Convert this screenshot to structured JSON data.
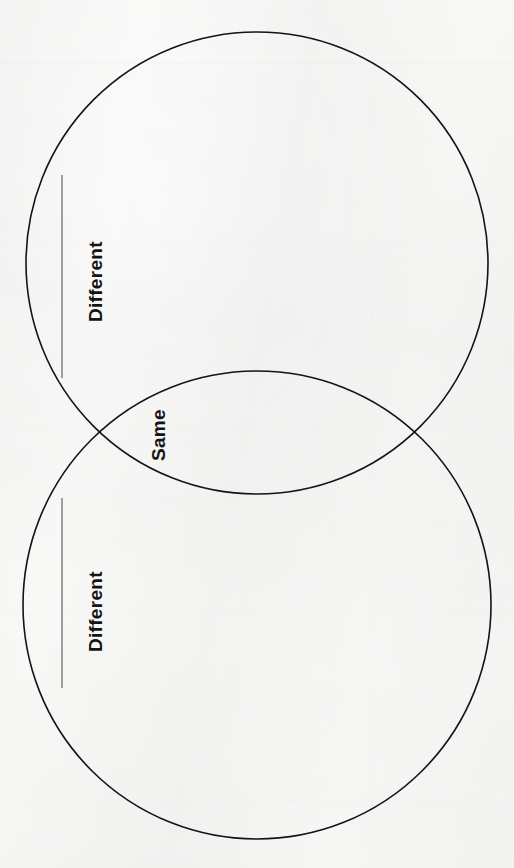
{
  "page": {
    "width": 514,
    "height": 868,
    "background_color": "#f8f8f7",
    "ink_color": "#141414"
  },
  "diagram": {
    "type": "venn",
    "orientation": "rotated-90-ccw",
    "circle_stroke_color": "#141414",
    "circle_stroke_width": 1.6,
    "circles": [
      {
        "name": "top-circle",
        "cx": 257,
        "cy": 263,
        "r": 231
      },
      {
        "name": "bottom-circle",
        "cx": 257,
        "cy": 605,
        "r": 234
      }
    ],
    "intersection_points": [
      {
        "x": 89,
        "y": 435
      },
      {
        "x": 428,
        "y": 435
      }
    ]
  },
  "labels": {
    "different_top": "Different",
    "same": "Same",
    "different_bottom": "Different"
  },
  "leader_lines": [
    {
      "name": "different-top-line",
      "x": 62,
      "y1": 175,
      "y2": 378
    },
    {
      "name": "different-bottom-line",
      "x": 62,
      "y1": 498,
      "y2": 688
    }
  ]
}
